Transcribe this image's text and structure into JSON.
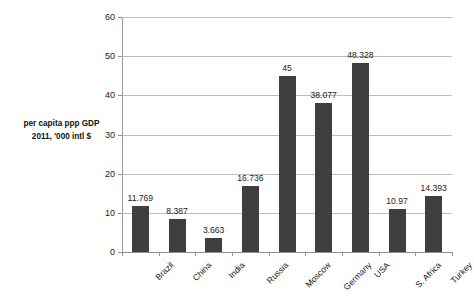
{
  "chart_data": {
    "type": "bar",
    "title": "",
    "subtitle": "",
    "xlabel": "",
    "ylabel": "per capita ppp GDP 2011, '000 intl $",
    "ylabel_lines": [
      "per capita ppp GDP",
      "2011, '000 intl $"
    ],
    "categories": [
      "Brazil",
      "China",
      "India",
      "Russia",
      "Moscow",
      "Germany",
      "USA",
      "S. Africa",
      "Turkey"
    ],
    "values": [
      11.769,
      8.387,
      3.663,
      16.736,
      45,
      38.077,
      48.328,
      10.97,
      14.393
    ],
    "value_labels": [
      "11.769",
      "8.387",
      "3.663",
      "16.736",
      "45",
      "38.077",
      "48.328",
      "10.97",
      "14.393"
    ],
    "ylim": [
      0,
      60
    ],
    "ytick_labels": [
      "0",
      "10",
      "20",
      "30",
      "40",
      "50",
      "60"
    ],
    "ytick_values": [
      0,
      10,
      20,
      30,
      40,
      50,
      60
    ],
    "grid": "horizontal",
    "legend": "none",
    "bar_color": "#3f3f3f",
    "gridline_color": "#bdbdbd",
    "axis_color": "#8f8f8f",
    "background_color": "#ffffff",
    "text_color": "#1a1a1a"
  }
}
